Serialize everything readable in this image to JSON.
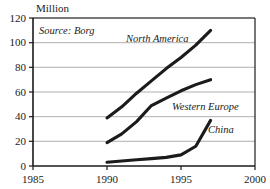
{
  "chart_data": {
    "type": "line",
    "title": "",
    "unit_label": "Million",
    "annotation": "Source: Borg",
    "xlabel": "",
    "ylabel": "",
    "xlim": [
      1985,
      2000
    ],
    "ylim": [
      0,
      120
    ],
    "xticks": [
      1985,
      1990,
      1995,
      2000
    ],
    "yticks": [
      0,
      20,
      40,
      60,
      80,
      100,
      120
    ],
    "grid": true,
    "legend_position": "inline-labels",
    "line_color": "#1b1b1b",
    "grid_color": "#9a9a9a",
    "axis_color": "#1b1b1b",
    "background": "#ffffff",
    "series": [
      {
        "name": "North America",
        "x": [
          1990,
          1991,
          1992,
          1993,
          1994,
          1995,
          1996,
          1997
        ],
        "values": [
          39,
          48,
          59,
          69,
          79,
          88,
          98,
          110
        ]
      },
      {
        "name": "Western Europe",
        "x": [
          1990,
          1991,
          1992,
          1993,
          1994,
          1995,
          1996,
          1997
        ],
        "values": [
          19,
          26,
          36,
          49,
          55,
          61,
          66,
          70
        ]
      },
      {
        "name": "China",
        "x": [
          1990,
          1991,
          1992,
          1993,
          1994,
          1995,
          1996,
          1997
        ],
        "values": [
          3,
          4,
          5,
          6,
          7,
          9,
          16,
          37
        ]
      }
    ]
  },
  "axis": {
    "y_tick_labels": [
      "0",
      "20",
      "40",
      "60",
      "80",
      "100",
      "120"
    ],
    "x_tick_labels": [
      "1985",
      "1990",
      "1995",
      "2000"
    ]
  },
  "labels": {
    "unit": "Million",
    "source": "Source: Borg",
    "north_america": "North America",
    "western_europe": "Western Europe",
    "china": "China"
  }
}
